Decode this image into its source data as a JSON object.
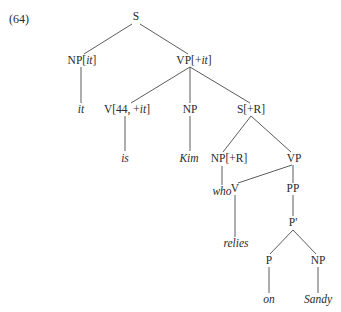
{
  "example_number": "(64)",
  "colors": {
    "text": "#2a2a2a",
    "branch": "#4a4a4a",
    "background": "#ffffff"
  },
  "nodes": {
    "S": {
      "label": "S",
      "x": 136,
      "y": 17
    },
    "NP_it": {
      "label_cat": "NP[",
      "label_feat": "it",
      "label_end": "]",
      "x": 82,
      "y": 61
    },
    "VP_it": {
      "label_cat": "VP[+",
      "label_feat": "it",
      "label_end": "]",
      "x": 194,
      "y": 61
    },
    "it": {
      "label": "it",
      "x": 81,
      "y": 110
    },
    "V_44": {
      "label_cat": "V[44, +",
      "label_feat": "it",
      "label_end": "]",
      "x": 127,
      "y": 110
    },
    "NP_1": {
      "label": "NP",
      "x": 190,
      "y": 110
    },
    "S_R": {
      "label": "S[+R]",
      "x": 251,
      "y": 110
    },
    "is": {
      "label": "is",
      "x": 125,
      "y": 159
    },
    "Kim": {
      "label": "Kim",
      "x": 189,
      "y": 159
    },
    "NP_R": {
      "label": "NP[+R]",
      "x": 229,
      "y": 159
    },
    "VP_2": {
      "label": "VP",
      "x": 294,
      "y": 159
    },
    "who": {
      "label": "who",
      "x": 222,
      "y": 192
    },
    "V": {
      "label": "V",
      "x": 235,
      "y": 189
    },
    "PP": {
      "label": "PP",
      "x": 293,
      "y": 189
    },
    "P_bar": {
      "label": "P'",
      "x": 293,
      "y": 223
    },
    "relies": {
      "label": "relies",
      "x": 236,
      "y": 244
    },
    "P": {
      "label": "P",
      "x": 269,
      "y": 261
    },
    "NP_2": {
      "label": "NP",
      "x": 318,
      "y": 261
    },
    "on": {
      "label": "on",
      "x": 269,
      "y": 300
    },
    "Sandy": {
      "label": "Sandy",
      "x": 318,
      "y": 300
    }
  },
  "branches": [
    [
      "S",
      "NP_it"
    ],
    [
      "S",
      "VP_it"
    ],
    [
      "NP_it",
      "it"
    ],
    [
      "VP_it",
      "V_44"
    ],
    [
      "VP_it",
      "NP_1"
    ],
    [
      "VP_it",
      "S_R"
    ],
    [
      "V_44",
      "is"
    ],
    [
      "NP_1",
      "Kim"
    ],
    [
      "S_R",
      "NP_R"
    ],
    [
      "S_R",
      "VP_2"
    ],
    [
      "NP_R",
      "who"
    ],
    [
      "VP_2",
      "V"
    ],
    [
      "VP_2",
      "PP"
    ],
    [
      "V",
      "relies"
    ],
    [
      "PP",
      "P_bar"
    ],
    [
      "P_bar",
      "P"
    ],
    [
      "P_bar",
      "NP_2"
    ],
    [
      "P",
      "on"
    ],
    [
      "NP_2",
      "Sandy"
    ]
  ]
}
